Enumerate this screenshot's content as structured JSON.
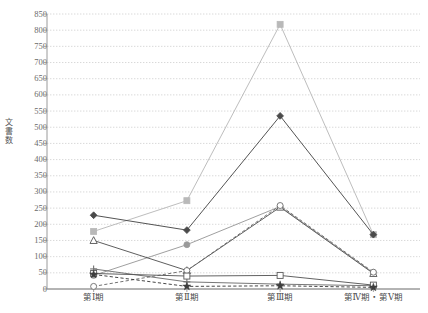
{
  "chart_data": {
    "type": "line",
    "title": "",
    "xlabel": "",
    "ylabel": "文書数",
    "ylim": [
      0,
      850
    ],
    "ytick_step": 50,
    "grid": true,
    "legend": "none",
    "categories": [
      "第Ⅰ期",
      "第Ⅱ期",
      "第Ⅲ期",
      "第Ⅳ期・第Ⅴ期"
    ],
    "yticks": [
      "0",
      "50",
      "100",
      "150",
      "200",
      "250",
      "300",
      "350",
      "400",
      "450",
      "500",
      "550",
      "600",
      "650",
      "700",
      "750",
      "800",
      "850"
    ],
    "series": [
      {
        "name": "series-gray-square",
        "marker": "square",
        "color": "#b9b9b9",
        "dash": "solid",
        "values": [
          178,
          273,
          818,
          168
        ]
      },
      {
        "name": "series-black-diamond",
        "marker": "diamond",
        "color": "#4a4a4a",
        "dash": "solid",
        "values": [
          228,
          182,
          535,
          168
        ]
      },
      {
        "name": "series-gray-circle",
        "marker": "circle-filled",
        "color": "#9a9a9a",
        "dash": "solid",
        "values": [
          42,
          137,
          255,
          50
        ]
      },
      {
        "name": "series-open-triangle",
        "marker": "triangle-open",
        "color": "#555555",
        "dash": "solid",
        "values": [
          150,
          57,
          253,
          48
        ]
      },
      {
        "name": "series-open-circle",
        "marker": "circle-open",
        "color": "#6b6b6b",
        "dash": "dashed",
        "values": [
          8,
          57,
          258,
          52
        ]
      },
      {
        "name": "series-plus",
        "marker": "plus",
        "color": "#707070",
        "dash": "solid",
        "values": [
          62,
          22,
          15,
          10
        ]
      },
      {
        "name": "series-open-square",
        "marker": "square-open",
        "color": "#5a5a5a",
        "dash": "solid",
        "values": [
          48,
          40,
          42,
          12
        ]
      },
      {
        "name": "series-star",
        "marker": "star",
        "color": "#3d3d3d",
        "dash": "dashed",
        "values": [
          45,
          8,
          10,
          5
        ]
      }
    ]
  }
}
